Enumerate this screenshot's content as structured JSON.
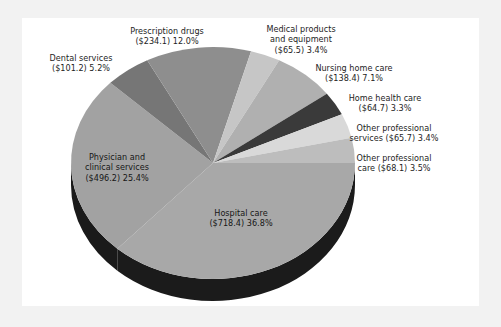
{
  "figure": {
    "background_color": "#f2f2f2",
    "panel_color": "#ffffff",
    "text_color": "#1d1d1d"
  },
  "chart_data": {
    "type": "pie",
    "title": "",
    "subtitle": "",
    "xlabel": "",
    "ylabel": "",
    "legend_position": "none",
    "grid": false,
    "units": "billions of dollars",
    "total": 1952.3,
    "categories": [
      "Hospital care",
      "Physician and clinical services",
      "Dental services",
      "Prescription drugs",
      "Medical products and equipment",
      "Nursing home care",
      "Home health care",
      "Other professional services",
      "Other professional care"
    ],
    "values": [
      718.4,
      496.2,
      101.2,
      234.1,
      65.5,
      138.4,
      64.7,
      65.7,
      68.1
    ],
    "percents": [
      36.8,
      25.4,
      5.2,
      12.0,
      3.4,
      7.1,
      3.3,
      3.4,
      3.5
    ],
    "colors": [
      "#a8a8a8",
      "#a2a2a2",
      "#767676",
      "#8e8e8e",
      "#c6c6c6",
      "#b0b0b0",
      "#3a3a3a",
      "#d9d9d9",
      "#bdbdbd"
    ],
    "slices": [
      {
        "name": "Hospital care",
        "value": 718.4,
        "value_text": "($718.4)",
        "percent": 36.8,
        "percent_text": "36.8%",
        "label": "Hospital care\n($718.4) 36.8%",
        "color": "#a8a8a8"
      },
      {
        "name": "Physician and clinical services",
        "value": 496.2,
        "value_text": "($496.2)",
        "percent": 25.4,
        "percent_text": "25.4%",
        "label": "Physician and\nclinical services\n($496.2) 25.4%",
        "color": "#a2a2a2"
      },
      {
        "name": "Dental services",
        "value": 101.2,
        "value_text": "($101.2)",
        "percent": 5.2,
        "percent_text": "5.2%",
        "label": "Dental services\n($101.2) 5.2%",
        "color": "#767676"
      },
      {
        "name": "Prescription drugs",
        "value": 234.1,
        "value_text": "($234.1)",
        "percent": 12.0,
        "percent_text": "12.0%",
        "label": "Prescription drugs\n($234.1) 12.0%",
        "color": "#8e8e8e"
      },
      {
        "name": "Medical products and equipment",
        "value": 65.5,
        "value_text": "($65.5)",
        "percent": 3.4,
        "percent_text": "3.4%",
        "label": "Medical products\nand equipment\n($65.5) 3.4%",
        "color": "#c6c6c6"
      },
      {
        "name": "Nursing home care",
        "value": 138.4,
        "value_text": "($138.4)",
        "percent": 7.1,
        "percent_text": "7.1%",
        "label": "Nursing home care\n($138.4) 7.1%",
        "color": "#b0b0b0"
      },
      {
        "name": "Home health care",
        "value": 64.7,
        "value_text": "($64.7)",
        "percent": 3.3,
        "percent_text": "3.3%",
        "label": "Home health care\n($64.7) 3.3%",
        "color": "#3a3a3a"
      },
      {
        "name": "Other professional services",
        "value": 65.7,
        "value_text": "($65.7)",
        "percent": 3.4,
        "percent_text": "3.4%",
        "label": "Other professional\nservices ($65.7) 3.4%",
        "color": "#d9d9d9"
      },
      {
        "name": "Other professional care",
        "value": 68.1,
        "value_text": "($68.1)",
        "percent": 3.5,
        "percent_text": "3.5%",
        "label": "Other professional\ncare ($68.1) 3.5%",
        "color": "#bdbdbd"
      }
    ]
  }
}
